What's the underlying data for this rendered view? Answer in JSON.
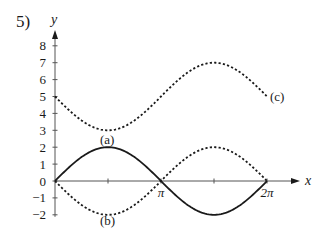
{
  "problem_number": "5)",
  "chart_data": {
    "type": "line",
    "title": "",
    "xlabel": "x",
    "ylabel": "y",
    "xlim": [
      0,
      6.2832
    ],
    "ylim": [
      -2,
      8
    ],
    "grid": false,
    "x_tick_labels": [
      {
        "value": 3.1416,
        "label": "π"
      },
      {
        "value": 6.2832,
        "label": "2π"
      }
    ],
    "x_ticks_unlabeled": [
      1.5708,
      4.7124
    ],
    "y_ticks": [
      8,
      7,
      6,
      5,
      4,
      3,
      2,
      1,
      0,
      -1,
      -2
    ],
    "y_tick_labels": [
      "8",
      "7",
      "6",
      "5",
      "4",
      "3",
      "2",
      "1",
      "0",
      "−1",
      "−2"
    ],
    "x": [
      0,
      0.7854,
      1.5708,
      2.3562,
      3.1416,
      3.927,
      4.7124,
      5.4978,
      6.2832
    ],
    "series": [
      {
        "name": "(a)",
        "style": "solid",
        "expression": "y = 2 sin x",
        "values": [
          0,
          1.41,
          2,
          1.41,
          0,
          -1.41,
          -2,
          -1.41,
          0
        ]
      },
      {
        "name": "(b)",
        "style": "dashed",
        "expression": "y = -2 sin x",
        "values": [
          0,
          -1.41,
          -2,
          -1.41,
          0,
          1.41,
          2,
          1.41,
          0
        ]
      },
      {
        "name": "(c)",
        "style": "dashed",
        "expression": "y = 5 - 2 sin x",
        "values": [
          5,
          3.59,
          3,
          3.59,
          5,
          6.41,
          7,
          6.41,
          5
        ]
      }
    ],
    "annotations": [
      {
        "text": "(a)",
        "near": [
          1.57,
          1.3
        ]
      },
      {
        "text": "(b)",
        "near": [
          1.57,
          -2.6
        ]
      },
      {
        "text": "(c)",
        "near": [
          6.3,
          5
        ]
      }
    ]
  }
}
